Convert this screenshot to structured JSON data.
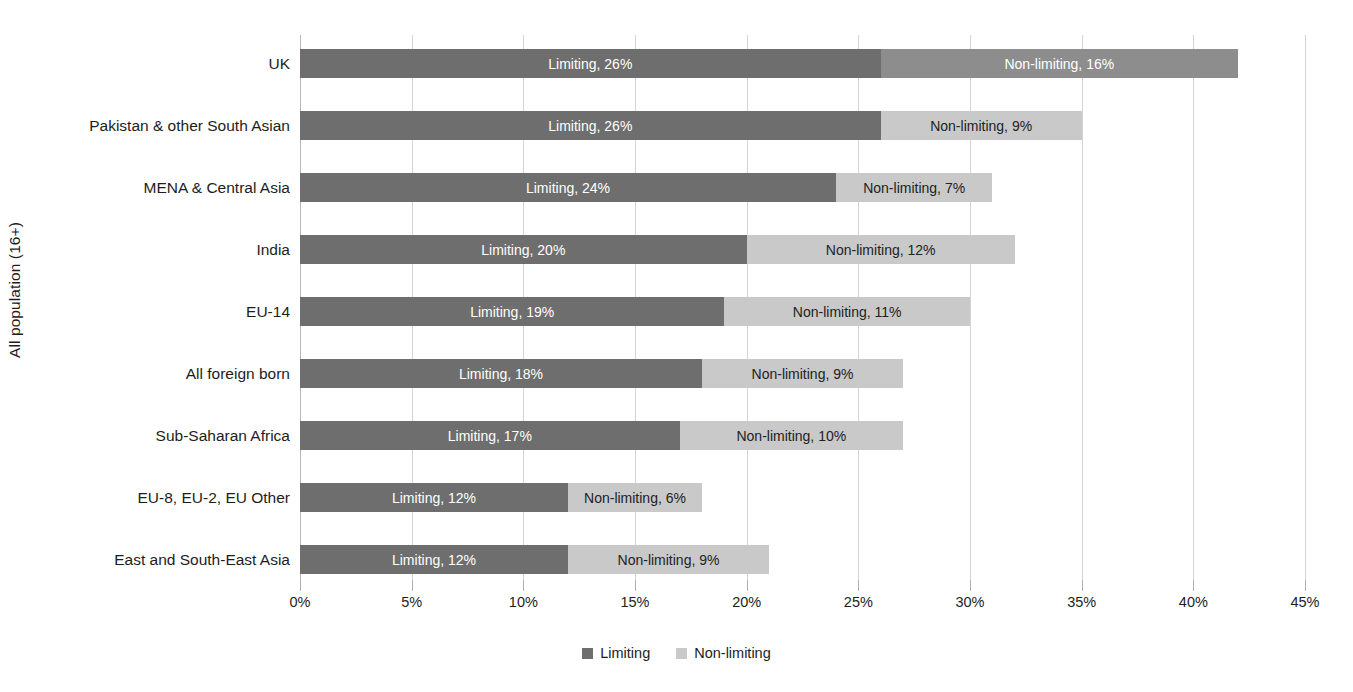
{
  "chart_data": {
    "type": "bar",
    "orientation": "horizontal",
    "stacked": true,
    "title": "",
    "xlabel": "",
    "ylabel": "All population (16+)",
    "xlim": [
      0,
      45
    ],
    "xtick_labels": [
      "0%",
      "5%",
      "10%",
      "15%",
      "20%",
      "25%",
      "30%",
      "35%",
      "40%",
      "45%"
    ],
    "xticks": [
      0,
      5,
      10,
      15,
      20,
      25,
      30,
      35,
      40,
      45
    ],
    "grid": true,
    "legend_position": "bottom",
    "categories": [
      "UK",
      "Pakistan & other South Asian",
      "MENA & Central Asia",
      "India",
      "EU-14",
      "All foreign born",
      "Sub-Saharan Africa",
      "EU-8, EU-2, EU Other",
      "East and South-East Asia"
    ],
    "series": [
      {
        "name": "Limiting",
        "color": "#6e6e6e",
        "values": [
          26,
          26,
          24,
          20,
          19,
          18,
          17,
          12,
          12
        ],
        "labels": [
          "Limiting, 26%",
          "Limiting, 26%",
          "Limiting, 24%",
          "Limiting, 20%",
          "Limiting, 19%",
          "Limiting, 18%",
          "Limiting, 17%",
          "Limiting, 12%",
          "Limiting, 12%"
        ]
      },
      {
        "name": "Non-limiting",
        "color": "#c9c9c9",
        "values": [
          16,
          9,
          7,
          12,
          11,
          9,
          10,
          6,
          9
        ],
        "labels": [
          "Non-limiting, 16%",
          "Non-limiting, 9%",
          "Non-limiting, 7%",
          "Non-limiting, 12%",
          "Non-limiting, 11%",
          "Non-limiting, 9%",
          "Non-limiting, 10%",
          "Non-limiting, 6%",
          "Non-limiting, 9%"
        ]
      }
    ],
    "totals": [
      42,
      35,
      31,
      32,
      30,
      27,
      27,
      18,
      21
    ]
  },
  "legend": {
    "items": [
      {
        "label": "Limiting",
        "color": "#6e6e6e"
      },
      {
        "label": "Non-limiting",
        "color": "#c9c9c9"
      }
    ]
  },
  "axis": {
    "y_title": "All population (16+)"
  }
}
